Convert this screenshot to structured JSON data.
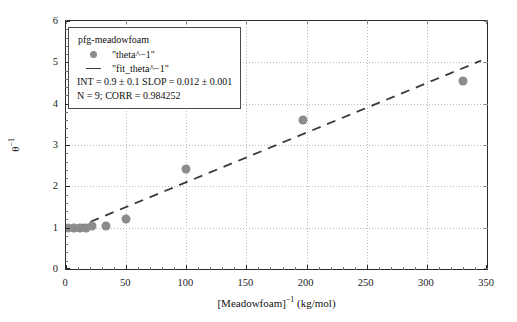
{
  "chart_data": {
    "type": "scatter",
    "title": "",
    "xlabel": "[Meadowfoam]⁻¹ (kg/mol)",
    "ylabel": "θ⁻¹",
    "xlim": [
      0,
      350
    ],
    "ylim": [
      0,
      6
    ],
    "xticks": [
      0,
      50,
      100,
      150,
      200,
      250,
      300,
      350
    ],
    "yticks": [
      0,
      1,
      2,
      3,
      4,
      5,
      6
    ],
    "xtick_labels": [
      "0",
      "50",
      "100",
      "150",
      "200",
      "250",
      "300",
      "350"
    ],
    "ytick_labels": [
      "0",
      "1",
      "2",
      "3",
      "4",
      "5",
      "6"
    ],
    "grid": true,
    "legend_position": "upper-left",
    "series": [
      {
        "name": "\"theta^−1\"",
        "type": "scatter",
        "marker": "filled-circle",
        "color": "#8c8c8c",
        "x": [
          2,
          7,
          12,
          17,
          22,
          33,
          50,
          100,
          197,
          330
        ],
        "y": [
          1.0,
          1.0,
          1.0,
          1.0,
          1.05,
          1.05,
          1.2,
          2.42,
          3.6,
          4.55
        ]
      },
      {
        "name": "\"fit_theta^−1\"",
        "type": "line",
        "style": "dashed",
        "color": "#3a3a3a",
        "intercept": 0.9,
        "slope": 0.012,
        "x": [
          8,
          345
        ],
        "y": [
          0.996,
          5.04
        ]
      }
    ]
  },
  "legend": {
    "title": "pfg-meadowfoam",
    "entry_marker_label": "\"theta^−1\"",
    "entry_line_label": "\"fit_theta^−1\"",
    "stat_fit": "INT = 0.9 ± 0.1 SLOP = 0.012 ± 0.001",
    "stat_corr": "N = 9; CORR = 0.984252"
  },
  "axes": {
    "x_title": "[Meadowfoam]",
    "x_title_sup": "−1",
    "x_title_units": " (kg/mol)",
    "y_title": "θ",
    "y_title_sup": "−1"
  },
  "colors": {
    "marker": "#8c8c8c",
    "fit_line": "#3a3a3a",
    "frame": "#2b2b2b",
    "grid": "#b9b9b9",
    "background": "#ffffff"
  }
}
